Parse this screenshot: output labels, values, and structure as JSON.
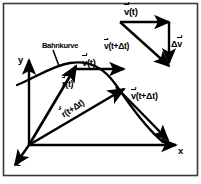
{
  "figure": {
    "name": "kinematics-velocity-change-diagram",
    "background_color": "#ffffff",
    "ink_color": "#000000",
    "border_color": "#3a3a3a"
  },
  "axes": {
    "x_label": "x",
    "y_label": "y",
    "z_label": "z",
    "origin_label": ""
  },
  "annotations": {
    "curve_label": "Bahnkurve",
    "position_vector_t": "r(t)",
    "position_vector_t_dt": "r(t+Δt)",
    "velocity_vector_t": "v(t)",
    "velocity_vector_t_dt": "v(t+Δt)",
    "delta_velocity": "Δv"
  },
  "vector_triangle": {
    "top_side_label": "v(t)",
    "right_side_label": "Δv",
    "hypotenuse_label": "v(t+Δt)"
  },
  "symbols": {
    "r_base": "r",
    "v_base": "v",
    "delta": "Δ",
    "t": "(t)",
    "t_dt": "(t+Δt)"
  }
}
